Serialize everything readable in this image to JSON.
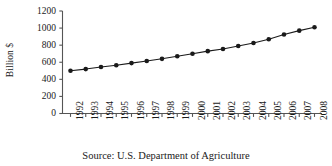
{
  "chart_data": {
    "type": "line",
    "title": "",
    "subtitle": "",
    "xlabel": "",
    "ylabel": "Billion $",
    "caption": "Source: U.S. Department of Agriculture",
    "categories": [
      "1992",
      "1993",
      "1994",
      "1995",
      "1996",
      "1997",
      "1998",
      "1999",
      "2000",
      "2001",
      "2002",
      "2003",
      "2004",
      "2005",
      "2006",
      "2007",
      "2008"
    ],
    "values": [
      500,
      520,
      545,
      565,
      590,
      615,
      640,
      670,
      700,
      730,
      755,
      790,
      825,
      870,
      925,
      970,
      1010
    ],
    "series": [
      {
        "name": "Billion $",
        "values": [
          500,
          520,
          545,
          565,
          590,
          615,
          640,
          670,
          700,
          730,
          755,
          790,
          825,
          870,
          925,
          970,
          1010
        ]
      }
    ],
    "ylim": [
      0,
      1200
    ],
    "yticks": [
      0,
      200,
      400,
      600,
      800,
      1000,
      1200
    ],
    "ytick_labels": [
      "0",
      "200",
      "400",
      "600",
      "800",
      "1000",
      "1200"
    ],
    "grid": false,
    "legend": "none",
    "marker": "filled-circle",
    "line_color": "#1a1a1a",
    "marker_color": "#1a1a1a",
    "axis_color": "#4d4d4d",
    "background": "#ffffff"
  }
}
